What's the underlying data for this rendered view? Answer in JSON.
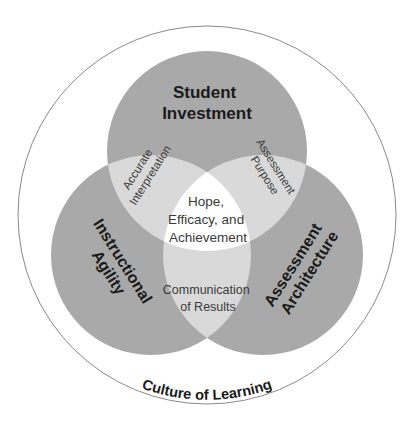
{
  "diagram": {
    "type": "venn",
    "outer_label": "Culture of Learning",
    "circles": {
      "top": {
        "line1": "Student",
        "line2": "Investment"
      },
      "left": {
        "line1": "Instructional",
        "line2": "Agility"
      },
      "right": {
        "line1": "Assessment",
        "line2": "Architecture"
      }
    },
    "overlaps": {
      "top_left": {
        "line1": "Accurate",
        "line2": "Interpretation"
      },
      "top_right": {
        "line1": "Assessment",
        "line2": "Purpose"
      },
      "bottom": {
        "line1": "Communication",
        "line2": "of Results"
      },
      "center": {
        "line1": "Hope,",
        "line2": "Efficacy, and",
        "line3": "Achievement"
      }
    },
    "colors": {
      "circle_fill": "#a9a9a9",
      "overlap_fill": "#d9d9d9",
      "center_fill": "#ffffff",
      "outer_stroke": "#8a8a8a"
    }
  }
}
